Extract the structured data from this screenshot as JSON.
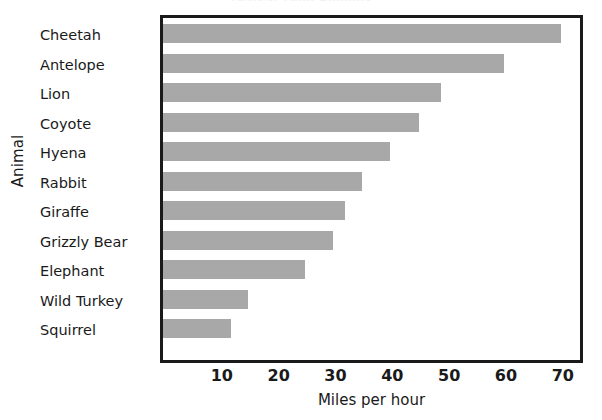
{
  "chart_data": {
    "type": "bar",
    "orientation": "horizontal",
    "title": "Fastest Land Animals",
    "xlabel": "Miles per hour",
    "ylabel": "Animal",
    "categories": [
      "Cheetah",
      "Antelope",
      "Lion",
      "Coyote",
      "Hyena",
      "Rabbit",
      "Giraffe",
      "Grizzly Bear",
      "Elephant",
      "Wild Turkey",
      "Squirrel"
    ],
    "values": [
      70,
      60,
      49,
      45,
      40,
      35,
      32,
      30,
      25,
      15,
      12
    ],
    "xticks": [
      10,
      20,
      30,
      40,
      50,
      60,
      70
    ],
    "xlim": [
      0,
      74
    ],
    "grid": false,
    "legend": false,
    "bar_color": "#a8a8a8",
    "frame_color": "#1a1a1a",
    "background": "#ffffff"
  },
  "axes": {
    "x_title": "Miles per hour",
    "y_title": "Animal"
  }
}
